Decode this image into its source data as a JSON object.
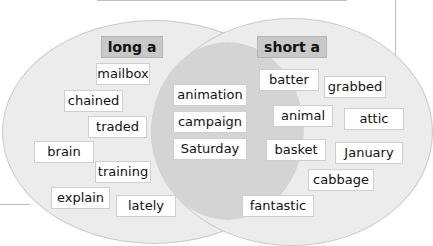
{
  "diagram": {
    "type": "venn",
    "left": {
      "title": "long a",
      "words": [
        "mailbox",
        "chained",
        "traded",
        "brain",
        "training",
        "explain",
        "lately"
      ]
    },
    "overlap": {
      "words": [
        "animation",
        "campaign",
        "Saturday"
      ]
    },
    "right": {
      "title": "short a",
      "words": [
        "batter",
        "grabbed",
        "animal",
        "attic",
        "basket",
        "January",
        "cabbage",
        "fantastic"
      ]
    }
  }
}
